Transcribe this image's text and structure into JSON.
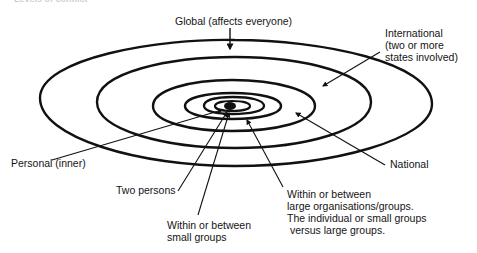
{
  "figure": {
    "cropped_title": "Levels of conflict",
    "center_label_count": 7
  },
  "labels": {
    "global": "Global (affects everyone)",
    "international": "International\n(two or more\nstates involved)",
    "national": "National",
    "personal": "Personal (inner)",
    "two_persons": "Two persons",
    "small_groups": "Within or between\nsmall groups",
    "large_groups": "Within or between\nlarge organisations/groups.\nThe individual or small groups\n versus large groups."
  },
  "levels": [
    {
      "name": "Global",
      "ring": 1
    },
    {
      "name": "International",
      "ring": 2
    },
    {
      "name": "National",
      "ring": 3
    },
    {
      "name": "Within or between large organisations/groups",
      "ring": 4
    },
    {
      "name": "Within or between small groups",
      "ring": 5
    },
    {
      "name": "Two persons",
      "ring": 6
    },
    {
      "name": "Personal (inner)",
      "ring": 7
    }
  ],
  "colors": {
    "ink": "#111111",
    "background": "#ffffff"
  }
}
